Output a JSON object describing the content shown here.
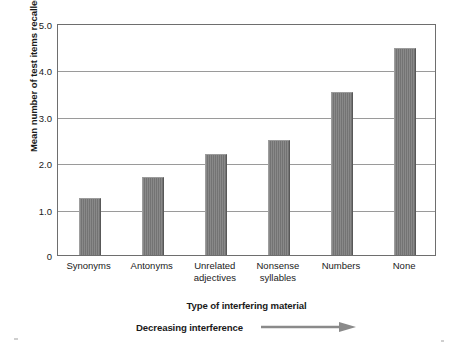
{
  "chart_data": {
    "type": "bar",
    "title": "",
    "subtitle": "",
    "xlabel": "Type of interfering material",
    "ylabel": "Mean number of test items recalled",
    "categories": [
      "Synonyms",
      "Antonyms",
      "Unrelated adjectives",
      "Nonsense syllables",
      "Numbers",
      "None"
    ],
    "category_lines": [
      [
        "Synonyms"
      ],
      [
        "Antonyms"
      ],
      [
        "Unrelated",
        "adjectives"
      ],
      [
        "Nonsense",
        "syllables"
      ],
      [
        "Numbers"
      ],
      [
        "None"
      ]
    ],
    "values": [
      1.25,
      1.7,
      2.2,
      2.5,
      3.55,
      4.5
    ],
    "ylim": [
      0,
      5.0
    ],
    "yticks": [
      0,
      1.0,
      2.0,
      3.0,
      4.0,
      5.0
    ],
    "ytick_labels": [
      "0",
      "1.0",
      "2.0",
      "3.0",
      "4.0",
      "5.0"
    ],
    "grid": true,
    "grid_axis": "y",
    "legend": "none",
    "bar_color": "#7c7c7c",
    "gridline_color": "#9a9a9a",
    "frame_color": "#6e6e6e",
    "annotation": {
      "label": "Decreasing interference",
      "arrow": "right-arrow-icon",
      "direction": "left-to-right"
    }
  },
  "figure": {
    "background": "#ffffff",
    "text_color": "#1a1a1a"
  }
}
